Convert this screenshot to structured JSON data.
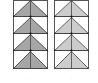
{
  "diagram": {
    "panels": [
      {
        "id": "left",
        "fill": "#a6a6a6",
        "stroke": "#333333",
        "rows": 4,
        "caption": "· · ·"
      },
      {
        "id": "right",
        "fill": "#cccccc",
        "stroke": "#444444",
        "rows": 4,
        "caption": "·"
      }
    ]
  }
}
